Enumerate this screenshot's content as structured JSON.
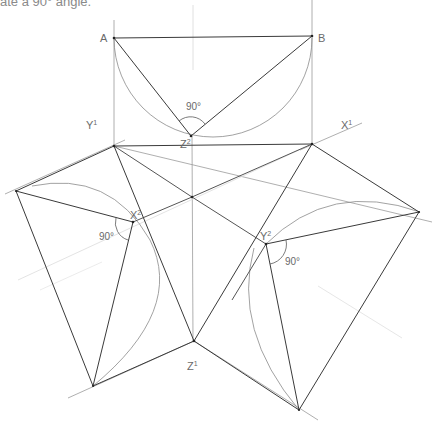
{
  "caption": "ate a 90° angle.",
  "labels": {
    "A": "A",
    "B": "B",
    "Z2": "Z",
    "Z2_sup": "2",
    "Y1": "Y",
    "Y1_sup": "1",
    "X1": "X",
    "X1_sup": "1",
    "X2": "X",
    "X2_sup": "2",
    "Y2": "Y",
    "Y2_sup": "2",
    "Z1": "Z",
    "Z1_sup": "1",
    "angle_top": "90°",
    "angle_left": "90°",
    "angle_right": "90°"
  },
  "colors": {
    "line": "#3a3a3a",
    "construction": "#9a9a9a",
    "faint": "#d8d8d8",
    "text": "#6a6a6a"
  }
}
